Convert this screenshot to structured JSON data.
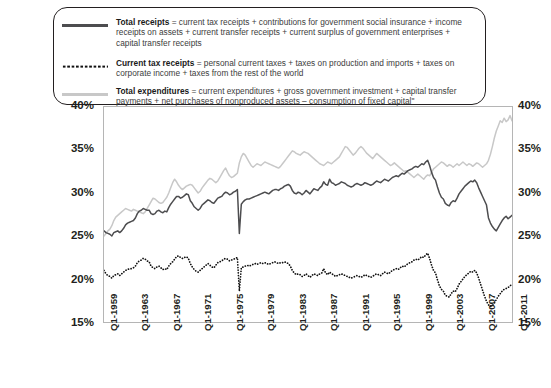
{
  "legend": {
    "entries": [
      {
        "swatch": "solid-dark-line",
        "term": "Total receipts",
        "definition": " = current tax receipts + contributions for government social insurance + income receipts on assets + current transfer receipts + current surplus of government enterprises + capital transfer receipts"
      },
      {
        "swatch": "dotted-black-line",
        "term": "Current tax receipts",
        "definition": " = personal current taxes + taxes on production and imports + taxes on corporate income + taxes from the rest of the world"
      },
      {
        "swatch": "solid-light-line",
        "term": "Total expenditures",
        "definition": " = current expenditures + gross government investment + capital transfer payments + net purchases of nonproduced assets – consumption of fixed capital\""
      }
    ]
  },
  "axis": {
    "y_ticks_left": [
      "40%",
      "35%",
      "30%",
      "25%",
      "20%",
      "15%"
    ],
    "y_ticks_right": [
      "40%",
      "35%",
      "30%",
      "25%",
      "20%",
      "15%"
    ],
    "x_ticks": [
      "Q1-1959",
      "Q1-1963",
      "Q1-1967",
      "Q1-1971",
      "Q1-1975",
      "Q1-1979",
      "Q1-1983",
      "Q1-1987",
      "Q1-1991",
      "Q1-1995",
      "Q1-1999",
      "Q1-2003",
      "Q1-2007",
      "Q1-2011"
    ]
  },
  "colors": {
    "total_receipts": "#4d4d4f",
    "current_tax_receipts": "#111111",
    "total_expenditures": "#c8c8c8",
    "frame": "#b5b5b5",
    "text": "#231f20"
  },
  "chart_data": {
    "type": "line",
    "title": "",
    "xlabel": "",
    "ylabel": "",
    "ylim": [
      15,
      40
    ],
    "grid": false,
    "legend_position": "top",
    "x_start_label": "Q1-1959",
    "x_end_label": "Q2-2011",
    "x_tick_labels": [
      "Q1-1959",
      "Q1-1963",
      "Q1-1967",
      "Q1-1971",
      "Q1-1975",
      "Q1-1979",
      "Q1-1983",
      "Q1-1987",
      "Q1-1991",
      "Q1-1995",
      "Q1-1999",
      "Q1-2003",
      "Q1-2007",
      "Q1-2011"
    ],
    "x_tick_indices": [
      0,
      16,
      32,
      48,
      64,
      80,
      96,
      112,
      128,
      144,
      160,
      176,
      192,
      208
    ],
    "series": [
      {
        "name": "Total receipts",
        "style": "solid",
        "color": "#4d4d4f",
        "values": [
          25.6,
          25.4,
          25.3,
          25.2,
          25.0,
          25.4,
          25.5,
          25.6,
          25.4,
          25.6,
          25.9,
          26.3,
          26.5,
          26.6,
          26.7,
          26.8,
          27.1,
          27.6,
          27.9,
          28.0,
          28.2,
          28.1,
          28.0,
          28.0,
          27.6,
          27.5,
          27.6,
          27.9,
          28.0,
          27.8,
          27.7,
          27.9,
          27.8,
          28.3,
          28.7,
          29.0,
          29.3,
          29.6,
          29.6,
          29.4,
          29.5,
          29.7,
          29.9,
          29.8,
          29.1,
          28.8,
          28.4,
          28.2,
          28.0,
          28.2,
          28.6,
          28.8,
          29.0,
          29.2,
          29.1,
          28.9,
          28.8,
          29.1,
          29.4,
          29.5,
          29.6,
          29.9,
          30.1,
          30.0,
          29.8,
          29.9,
          30.1,
          30.2,
          30.4,
          25.3,
          28.7,
          29.0,
          29.2,
          29.3,
          29.3,
          29.4,
          29.5,
          29.6,
          29.7,
          29.8,
          29.9,
          30.0,
          30.1,
          30.0,
          29.9,
          30.1,
          30.3,
          30.4,
          30.4,
          30.3,
          30.5,
          30.6,
          30.8,
          30.9,
          31.0,
          30.8,
          30.3,
          30.0,
          29.9,
          30.1,
          30.0,
          29.8,
          30.0,
          30.3,
          30.1,
          29.9,
          30.2,
          30.5,
          30.4,
          30.3,
          30.6,
          30.8,
          31.3,
          31.0,
          30.9,
          31.6,
          31.2,
          31.1,
          30.9,
          31.0,
          31.1,
          31.3,
          31.2,
          31.1,
          30.9,
          30.8,
          30.7,
          30.8,
          31.0,
          31.1,
          31.0,
          30.9,
          31.0,
          31.2,
          31.1,
          31.0,
          30.9,
          31.0,
          31.2,
          31.4,
          31.3,
          31.2,
          31.4,
          31.6,
          31.5,
          31.4,
          31.6,
          31.8,
          31.9,
          32.0,
          31.9,
          32.1,
          32.3,
          32.2,
          32.4,
          32.6,
          32.7,
          32.8,
          33.0,
          33.1,
          33.0,
          33.2,
          33.4,
          33.3,
          33.6,
          33.8,
          33.2,
          32.4,
          31.8,
          31.5,
          30.7,
          30.0,
          29.5,
          29.3,
          28.8,
          28.6,
          28.5,
          28.9,
          29.1,
          29.0,
          29.4,
          29.9,
          30.2,
          30.5,
          30.8,
          31.0,
          31.2,
          31.4,
          31.3,
          31.5,
          31.2,
          30.6,
          30.1,
          29.6,
          29.1,
          28.6,
          27.1,
          26.5,
          26.1,
          25.8,
          25.6,
          26.0,
          26.4,
          26.8,
          27.1,
          27.3,
          27.0,
          27.2,
          27.4
        ]
      },
      {
        "name": "Current tax receipts",
        "style": "dotted",
        "color": "#111111",
        "values": [
          21.0,
          20.6,
          20.4,
          20.3,
          20.1,
          20.4,
          20.5,
          20.6,
          20.4,
          20.6,
          20.8,
          21.0,
          21.1,
          21.2,
          21.2,
          21.3,
          21.5,
          21.9,
          22.1,
          22.2,
          22.4,
          22.3,
          22.1,
          22.0,
          21.5,
          21.3,
          21.2,
          21.4,
          21.5,
          21.3,
          21.1,
          21.2,
          21.1,
          21.5,
          21.8,
          22.0,
          22.3,
          22.6,
          22.7,
          22.5,
          22.4,
          22.5,
          22.6,
          22.4,
          21.8,
          21.4,
          21.1,
          20.9,
          20.8,
          21.0,
          21.2,
          21.4,
          21.6,
          21.8,
          21.6,
          21.4,
          21.3,
          21.6,
          21.9,
          22.0,
          22.1,
          22.3,
          22.4,
          22.3,
          22.1,
          22.2,
          22.3,
          22.4,
          22.5,
          18.6,
          21.3,
          21.4,
          21.5,
          21.6,
          21.5,
          21.6,
          21.7,
          21.8,
          21.7,
          21.8,
          21.9,
          21.8,
          21.9,
          21.8,
          21.7,
          21.8,
          21.9,
          22.0,
          21.9,
          21.8,
          21.9,
          21.9,
          22.0,
          21.9,
          21.8,
          21.5,
          21.0,
          20.7,
          20.5,
          20.6,
          20.5,
          20.3,
          20.4,
          20.6,
          20.4,
          20.2,
          20.4,
          20.6,
          20.5,
          20.4,
          20.6,
          20.7,
          21.2,
          20.7,
          20.5,
          20.8,
          20.6,
          20.5,
          20.3,
          20.4,
          20.5,
          20.6,
          20.5,
          20.4,
          20.3,
          20.2,
          20.1,
          20.2,
          20.3,
          20.4,
          20.3,
          20.2,
          20.3,
          20.5,
          20.4,
          20.3,
          20.2,
          20.3,
          20.5,
          20.6,
          20.5,
          20.4,
          20.6,
          20.8,
          20.7,
          20.6,
          20.8,
          21.0,
          21.1,
          21.2,
          21.1,
          21.3,
          21.5,
          21.4,
          21.6,
          21.8,
          21.9,
          22.0,
          22.2,
          22.3,
          22.2,
          22.4,
          22.6,
          22.5,
          22.8,
          23.0,
          22.4,
          21.6,
          21.0,
          20.7,
          19.9,
          19.2,
          18.8,
          18.6,
          18.1,
          18.0,
          17.9,
          18.3,
          18.6,
          18.5,
          18.9,
          19.4,
          19.7,
          20.0,
          20.3,
          20.5,
          20.7,
          20.9,
          20.8,
          21.0,
          20.7,
          20.1,
          19.4,
          18.7,
          18.0,
          17.4,
          17.0,
          16.8,
          16.9,
          17.2,
          17.6,
          18.0,
          18.3,
          18.6,
          18.8,
          18.9,
          19.0,
          19.2,
          19.4
        ]
      },
      {
        "name": "Total expenditures",
        "style": "solid",
        "color": "#c8c8c8",
        "values": [
          25.0,
          25.3,
          25.6,
          25.8,
          26.2,
          26.8,
          27.2,
          27.4,
          27.6,
          27.8,
          28.0,
          28.2,
          28.1,
          28.0,
          27.9,
          28.1,
          28.0,
          27.9,
          27.8,
          27.7,
          27.6,
          27.8,
          28.2,
          28.6,
          29.0,
          29.4,
          29.3,
          29.1,
          28.9,
          28.8,
          28.9,
          29.2,
          29.5,
          30.0,
          30.6,
          31.2,
          31.6,
          31.3,
          30.9,
          30.6,
          30.4,
          30.6,
          30.8,
          30.9,
          31.0,
          30.9,
          30.6,
          30.3,
          30.0,
          30.2,
          30.6,
          30.9,
          31.2,
          31.5,
          31.7,
          31.6,
          31.4,
          31.2,
          31.4,
          31.8,
          32.2,
          32.6,
          32.9,
          32.4,
          32.0,
          31.8,
          31.9,
          32.1,
          32.3,
          33.5,
          34.2,
          34.6,
          34.4,
          34.0,
          33.6,
          33.2,
          33.0,
          33.2,
          33.4,
          33.3,
          33.2,
          33.4,
          33.6,
          33.5,
          33.4,
          33.3,
          33.2,
          33.1,
          33.0,
          32.9,
          33.1,
          33.4,
          33.7,
          34.0,
          34.3,
          34.6,
          34.9,
          34.8,
          34.6,
          34.5,
          34.4,
          34.6,
          34.8,
          34.7,
          34.6,
          34.4,
          34.2,
          34.0,
          33.8,
          33.6,
          33.4,
          33.3,
          33.2,
          33.4,
          33.6,
          33.5,
          33.4,
          33.6,
          33.8,
          34.0,
          34.2,
          34.6,
          35.0,
          35.4,
          35.3,
          35.0,
          34.7,
          34.4,
          34.6,
          34.9,
          35.2,
          35.4,
          35.2,
          34.9,
          34.6,
          34.4,
          34.2,
          34.0,
          34.3,
          34.6,
          34.4,
          34.2,
          34.0,
          33.8,
          33.6,
          33.4,
          33.2,
          33.3,
          33.5,
          33.3,
          33.1,
          32.9,
          32.7,
          32.5,
          32.6,
          32.4,
          32.2,
          32.0,
          31.8,
          32.0,
          32.2,
          32.0,
          31.8,
          31.6,
          31.9,
          32.1,
          32.0,
          32.4,
          32.8,
          33.0,
          33.2,
          33.4,
          33.6,
          33.5,
          33.3,
          33.1,
          33.3,
          33.2,
          33.0,
          33.2,
          33.4,
          33.2,
          33.4,
          33.6,
          33.4,
          33.2,
          33.4,
          33.3,
          33.1,
          33.3,
          33.5,
          33.4,
          33.2,
          33.0,
          33.2,
          33.4,
          33.8,
          34.5,
          35.4,
          36.4,
          37.2,
          37.8,
          38.4,
          38.2,
          38.7,
          38.3,
          38.5,
          39.0,
          38.4,
          38.2,
          38.6
        ]
      }
    ]
  }
}
